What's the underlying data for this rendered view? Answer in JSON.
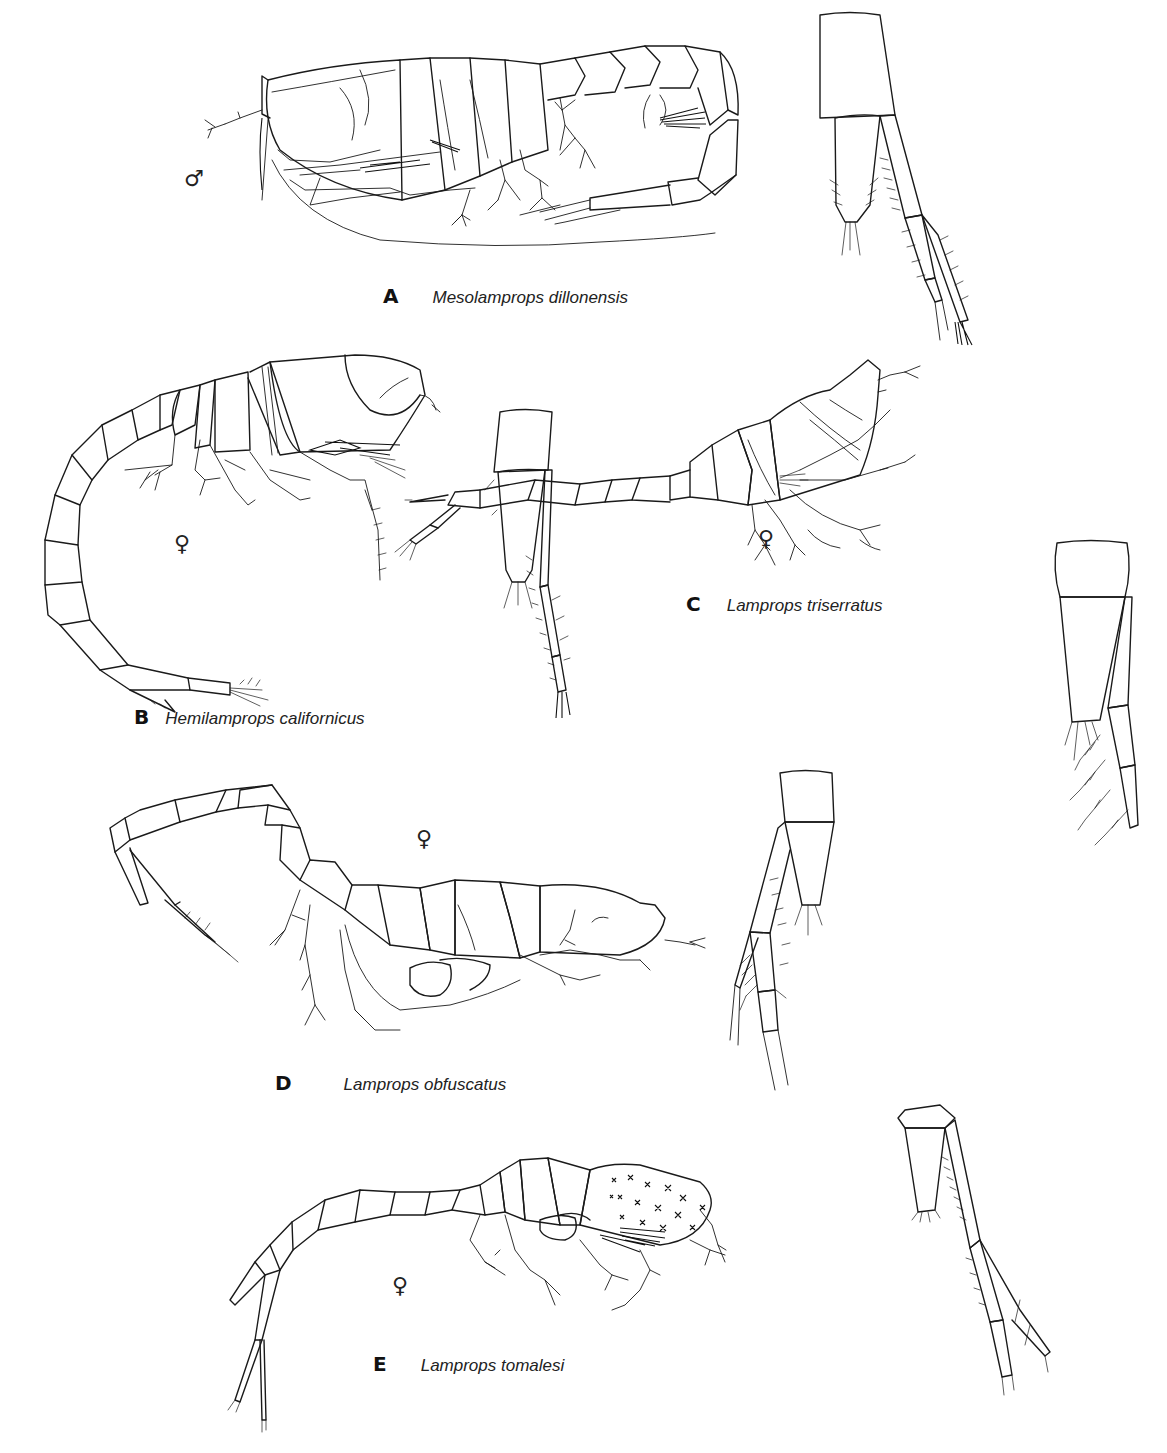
{
  "plate": {
    "figures": [
      {
        "letter": "A",
        "species": "Mesolamprops dillonensis",
        "sex": "♂",
        "sex_name": "male"
      },
      {
        "letter": "B",
        "species": "Hemilamprops californicus",
        "sex": "♀",
        "sex_name": "female"
      },
      {
        "letter": "C",
        "species": "Lamprops triserratus",
        "sex": "♀",
        "sex_name": "female"
      },
      {
        "letter": "D",
        "species": "Lamprops obfuscatus",
        "sex": "♀",
        "sex_name": "female"
      },
      {
        "letter": "E",
        "species": "Lamprops tomalesi",
        "sex": "♀",
        "sex_name": "female"
      }
    ],
    "panels": [
      {
        "id": "A",
        "contents": [
          "lateral habitus",
          "uropod detail"
        ]
      },
      {
        "id": "B",
        "contents": [
          "lateral habitus",
          "uropod detail"
        ]
      },
      {
        "id": "C",
        "contents": [
          "lateral habitus",
          "uropod detail"
        ]
      },
      {
        "id": "D",
        "contents": [
          "lateral habitus",
          "uropod detail"
        ]
      },
      {
        "id": "E",
        "contents": [
          "lateral habitus",
          "uropod detail"
        ]
      }
    ]
  }
}
